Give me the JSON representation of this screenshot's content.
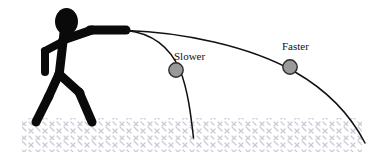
{
  "figure": {
    "width": 373,
    "height": 161,
    "background_color": "#ffffff"
  },
  "colors": {
    "ink": "#111111",
    "figure_fill": "#0a0a0a",
    "ball_fill": "#9a9a9a",
    "ball_stroke": "#2b2b2b",
    "ground_hatch": "#c9cbd6",
    "trajectory_stroke": "#111111"
  },
  "labels": [
    {
      "id": "slower",
      "text": "Slower",
      "x": 174,
      "y": 60,
      "anchor": "start"
    },
    {
      "id": "faster",
      "text": "Faster",
      "x": 282,
      "y": 50,
      "anchor": "start"
    }
  ],
  "balls": [
    {
      "id": "slower-ball",
      "name": "slower-projectile-ball",
      "cx": 176,
      "cy": 70,
      "r": 7.2
    },
    {
      "id": "faster-ball",
      "name": "faster-projectile-ball",
      "cx": 290,
      "cy": 67,
      "r": 7.2
    }
  ],
  "trajectories": [
    {
      "id": "slower-path",
      "name": "slower-trajectory-curve",
      "label_ref": "Slower",
      "stroke_width": 1.5,
      "path": "M 126.5,30.5 C 150,33 169,45 180,70 C 188,90 191,116 193.5,138"
    },
    {
      "id": "faster-path",
      "name": "faster-trajectory-curve",
      "label_ref": "Faster",
      "stroke_width": 1.5,
      "path": "M 126.5,30.5 C 180,32 250,46 295,72 C 330,92 352,118 365,143"
    }
  ],
  "thrower": {
    "name": "stick-figure-thrower",
    "head": {
      "cx": 66.5,
      "cy": 21.5,
      "rx": 11.5,
      "ry": 13.5
    },
    "strokes": [
      {
        "name": "torso",
        "d": "M 64,33 L 59,76",
        "width": 9
      },
      {
        "name": "throwing-arm-upper",
        "d": "M 63,40 L 92,30",
        "width": 9
      },
      {
        "name": "throwing-arm-fore",
        "d": "M 90,30 L 126,30",
        "width": 9
      },
      {
        "name": "trailing-arm-upper",
        "d": "M 62,42 L 45,51",
        "width": 8
      },
      {
        "name": "trailing-arm-fore",
        "d": "M 45,51 L 45,72",
        "width": 8
      },
      {
        "name": "front-leg-thigh",
        "d": "M 59,74 L 80,93",
        "width": 9
      },
      {
        "name": "front-leg-shin",
        "d": "M 79,92 L 92,122",
        "width": 9
      },
      {
        "name": "back-leg-thigh",
        "d": "M 59,74 L 48,98",
        "width": 9
      },
      {
        "name": "back-leg-shin",
        "d": "M 49,96 L 36,122",
        "width": 9
      }
    ]
  },
  "ground": {
    "name": "ground-hatching-band",
    "top": 118,
    "bottom": 152,
    "left": 22,
    "right": 362,
    "hatch_color": "#c9cbd6",
    "pattern": "diagonal-cross-hatch"
  }
}
